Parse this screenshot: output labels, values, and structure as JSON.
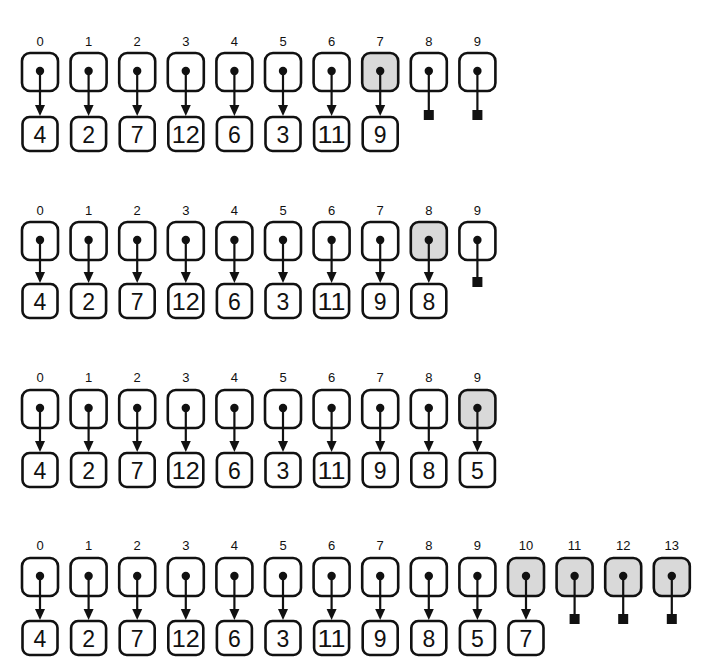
{
  "diagram": {
    "colors": {
      "stroke": "#111111",
      "highlight": "#d9d9d9",
      "background": "#ffffff"
    },
    "rows": [
      {
        "indices": [
          "0",
          "1",
          "2",
          "3",
          "4",
          "5",
          "6",
          "7",
          "8",
          "9"
        ],
        "values": [
          "4",
          "2",
          "7",
          "12",
          "6",
          "3",
          "11",
          "9"
        ],
        "highlighted": [
          7
        ],
        "null_slots": [
          8,
          9
        ]
      },
      {
        "indices": [
          "0",
          "1",
          "2",
          "3",
          "4",
          "5",
          "6",
          "7",
          "8",
          "9"
        ],
        "values": [
          "4",
          "2",
          "7",
          "12",
          "6",
          "3",
          "11",
          "9",
          "8"
        ],
        "highlighted": [
          8
        ],
        "null_slots": [
          9
        ]
      },
      {
        "indices": [
          "0",
          "1",
          "2",
          "3",
          "4",
          "5",
          "6",
          "7",
          "8",
          "9"
        ],
        "values": [
          "4",
          "2",
          "7",
          "12",
          "6",
          "3",
          "11",
          "9",
          "8",
          "5"
        ],
        "highlighted": [
          9
        ],
        "null_slots": []
      },
      {
        "indices": [
          "0",
          "1",
          "2",
          "3",
          "4",
          "5",
          "6",
          "7",
          "8",
          "9",
          "10",
          "11",
          "12",
          "13"
        ],
        "values": [
          "4",
          "2",
          "7",
          "12",
          "6",
          "3",
          "11",
          "9",
          "8",
          "5",
          "7"
        ],
        "highlighted": [
          10,
          11,
          12,
          13
        ],
        "null_slots": [
          11,
          12,
          13
        ]
      }
    ]
  }
}
